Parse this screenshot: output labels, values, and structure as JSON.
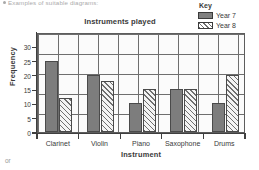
{
  "page": {
    "top_caption": "Examples of suitable diagrams:",
    "bottom_note": "or"
  },
  "key": {
    "title": "Key",
    "entries": [
      {
        "label": "Year 7",
        "swatch": "solid-gray-swatch",
        "color": "#808080"
      },
      {
        "label": "Year 8",
        "swatch": "hatched-swatch",
        "color": "#6f6f6f"
      }
    ]
  },
  "chart_data": {
    "type": "bar",
    "title": "Instruments played",
    "xlabel": "Instrument",
    "ylabel": "Frequency",
    "categories": [
      "Clarinet",
      "Violin",
      "Piano",
      "Saxophone",
      "Drums"
    ],
    "series": [
      {
        "name": "Year 7",
        "values": [
          25,
          20,
          10,
          15,
          10
        ],
        "fill": "solid",
        "color": "#7d7d7d"
      },
      {
        "name": "Year 8",
        "values": [
          12,
          18,
          15,
          15,
          20
        ],
        "fill": "hatched",
        "color": "#6f6f6f"
      }
    ],
    "ylim": [
      0,
      35
    ],
    "yticks": [
      0,
      5,
      10,
      15,
      20,
      25,
      30
    ],
    "ytick_labels": [
      "0",
      "5",
      "10",
      "15",
      "20",
      "25",
      "30"
    ],
    "grid": true,
    "grid_style": "graph-paper",
    "legend_position": "top-right",
    "legend_title": "Key"
  }
}
